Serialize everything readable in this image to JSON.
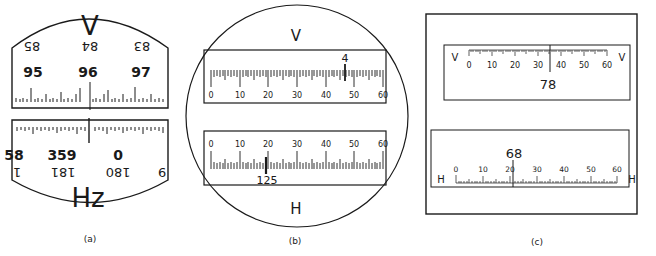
{
  "panels": {
    "a": {
      "caption": "(a)",
      "top_letter": "V",
      "bottom_letter": "Hz",
      "v_inverted_labels": [
        "85",
        "84",
        "83"
      ],
      "v_labels": [
        "95",
        "96",
        "97"
      ],
      "hz_labels": [
        "58",
        "359",
        "0"
      ],
      "hz_inverted_labels": [
        "1",
        "181",
        "180",
        "9"
      ]
    },
    "b": {
      "caption": "(b)",
      "top_letter": "V",
      "bottom_letter": "H",
      "v_scale_labels": [
        "0",
        "10",
        "20",
        "30",
        "40",
        "50",
        "60"
      ],
      "v_index_label": "4",
      "h_scale_labels": [
        "0",
        "10",
        "20",
        "30",
        "40",
        "50",
        "60"
      ],
      "h_index_label": "125"
    },
    "c": {
      "caption": "(c)",
      "v_left_letter": "V",
      "v_right_letter": "V",
      "v_scale_labels": [
        "0",
        "10",
        "20",
        "30",
        "40",
        "50",
        "60"
      ],
      "v_index_label": "78",
      "h_left_letter": "H",
      "h_right_letter": "H",
      "h_scale_labels": [
        "0",
        "10",
        "20",
        "30",
        "40",
        "50",
        "60"
      ],
      "h_index_label": "68"
    }
  }
}
